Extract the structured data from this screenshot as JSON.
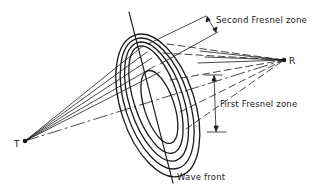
{
  "diagram": {
    "type": "fresnel-zone-schematic",
    "labels": {
      "second_zone": "Second Fresnel zone",
      "first_zone": "First Fresnel zone",
      "wave_front": "Wave front",
      "transmitter": "T",
      "receiver": "R"
    },
    "colors": {
      "ink": "#1a1a1a",
      "background": "#ffffff"
    },
    "elements": [
      "transmitter point T",
      "receiver point R",
      "concentric elliptical Fresnel zones",
      "wave front line",
      "ray lines from T to zones",
      "dashed lines from zones to R",
      "dash-dot direct path T to R",
      "dimension arrows for first and second Fresnel zones"
    ]
  }
}
